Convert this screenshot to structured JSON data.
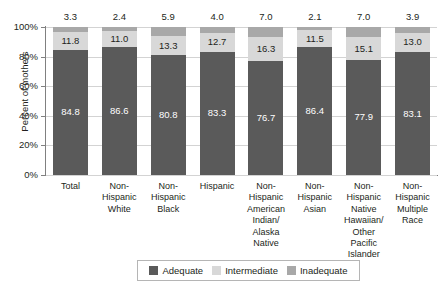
{
  "chart_data": {
    "type": "bar",
    "subtype": "stacked-bar-100-percent",
    "title": "",
    "xlabel": "",
    "ylabel": "Percent of mothers",
    "ylim": [
      0,
      100
    ],
    "y_tick_labels": [
      "100%",
      "80%",
      "60%",
      "40%",
      "20%",
      "0%"
    ],
    "y_ticks": [
      100,
      80,
      60,
      40,
      20,
      0
    ],
    "grid": true,
    "legend_position": "bottom",
    "categories": [
      "Total",
      "Non-Hispanic White",
      "Non-Hispanic Black",
      "Hispanic",
      "Non-Hispanic American Indian/ Alaska Native",
      "Non-Hispanic Asian",
      "Non-Hispanic Native Hawaiian/ Other Pacific Islander",
      "Non-Hispanic Multiple Race"
    ],
    "category_display": [
      "Total",
      "Non-\nHispanic\nWhite",
      "Non-\nHispanic\nBlack",
      "Hispanic",
      "Non-\nHispanic\nAmerican\nIndian/\nAlaska Native",
      "Non-\nHispanic\nAsian",
      "Non-\nHispanic\nNative\nHawaiian/\nOther\nPacific Islander",
      "Non-\nHispanic\nMultiple\nRace"
    ],
    "series": [
      {
        "name": "Adequate",
        "color": "#5a5a5a",
        "values": [
          84.8,
          86.6,
          80.8,
          83.3,
          76.7,
          86.4,
          77.9,
          83.1
        ]
      },
      {
        "name": "Intermediate",
        "color": "#d8d8d8",
        "values": [
          11.8,
          11.0,
          13.3,
          12.7,
          16.3,
          11.5,
          15.1,
          13.0
        ]
      },
      {
        "name": "Inadequate",
        "color": "#a8a8a8",
        "values": [
          3.3,
          2.4,
          5.9,
          4.0,
          7.0,
          2.1,
          7.0,
          3.9
        ]
      }
    ]
  },
  "legend": {
    "items": [
      {
        "label": "Adequate",
        "color": "#5a5a5a"
      },
      {
        "label": "Intermediate",
        "color": "#d8d8d8"
      },
      {
        "label": "Inadequate",
        "color": "#a8a8a8"
      }
    ]
  }
}
